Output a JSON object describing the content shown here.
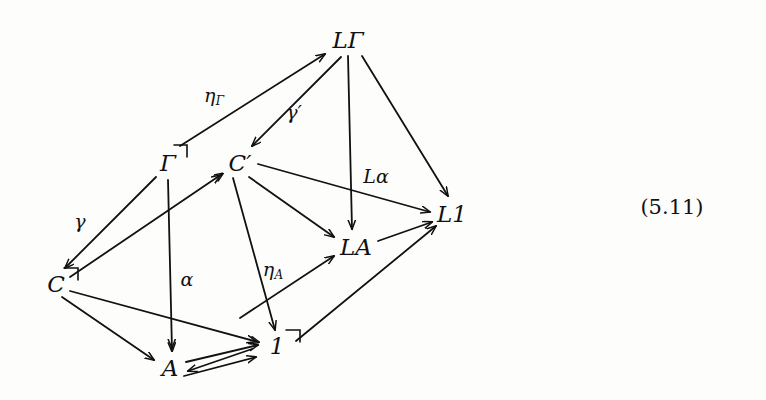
{
  "figure": {
    "kind": "commutative-diagram",
    "equation_number": "(5.11)",
    "equation_number_pos": {
      "x": 672,
      "y": 207
    },
    "background_color": "#fdfdfc",
    "ink_color": "#111111",
    "width": 766,
    "height": 400
  },
  "nodes": [
    {
      "id": "LGamma",
      "label": "LΓ",
      "x": 348,
      "y": 40,
      "corner_mark": false
    },
    {
      "id": "Gamma",
      "label": "Γ",
      "x": 168,
      "y": 163,
      "corner_mark": true
    },
    {
      "id": "Cprime",
      "label": "C′",
      "x": 240,
      "y": 163,
      "corner_mark": false
    },
    {
      "id": "L1",
      "label": "L1",
      "x": 452,
      "y": 214,
      "corner_mark": false
    },
    {
      "id": "LA",
      "label": "LA",
      "x": 356,
      "y": 247,
      "corner_mark": false
    },
    {
      "id": "C",
      "label": "C",
      "x": 56,
      "y": 284,
      "corner_mark": true
    },
    {
      "id": "one",
      "label": "1",
      "x": 277,
      "y": 346,
      "corner_mark": true
    },
    {
      "id": "A",
      "label": "A",
      "x": 170,
      "y": 368,
      "corner_mark": false
    }
  ],
  "edge_labels": [
    {
      "id": "eta-gamma",
      "base": "η",
      "sub": "Γ",
      "x": 214,
      "y": 96,
      "for": "Gamma->LGamma"
    },
    {
      "id": "gamma-prime",
      "base": "γ′",
      "sub": "",
      "x": 294,
      "y": 112,
      "for": "LGamma->Cprime"
    },
    {
      "id": "L-alpha",
      "base": "Lα",
      "sub": "",
      "x": 376,
      "y": 176,
      "for": "LGamma->LA"
    },
    {
      "id": "gamma",
      "base": "γ",
      "sub": "",
      "x": 80,
      "y": 221,
      "for": "Gamma->C"
    },
    {
      "id": "alpha",
      "base": "α",
      "sub": "",
      "x": 187,
      "y": 279,
      "for": "Gamma->A"
    },
    {
      "id": "eta-A",
      "base": "η",
      "sub": "A",
      "x": 273,
      "y": 270,
      "for": "A->LA"
    }
  ],
  "edges": [
    {
      "id": "Gamma->LGamma",
      "from": "Gamma",
      "to": "LGamma",
      "label": "ηΓ"
    },
    {
      "id": "LGamma->Cprime",
      "from": "LGamma",
      "to": "Cprime",
      "label": "γ′"
    },
    {
      "id": "LGamma->LA",
      "from": "LGamma",
      "to": "LA",
      "label": "Lα"
    },
    {
      "id": "LGamma->L1",
      "from": "LGamma",
      "to": "L1",
      "label": ""
    },
    {
      "id": "Cprime->L1",
      "from": "Cprime",
      "to": "L1",
      "label": ""
    },
    {
      "id": "Cprime->LA",
      "from": "Cprime",
      "to": "LA",
      "label": ""
    },
    {
      "id": "Cprime->one",
      "from": "Cprime",
      "to": "one",
      "label": ""
    },
    {
      "id": "Gamma->C",
      "from": "Gamma",
      "to": "C",
      "label": "γ"
    },
    {
      "id": "Gamma->A",
      "from": "Gamma",
      "to": "A",
      "label": "α"
    },
    {
      "id": "C->Cprime",
      "from": "C",
      "to": "Cprime",
      "label": ""
    },
    {
      "id": "C->A",
      "from": "C",
      "to": "A",
      "label": ""
    },
    {
      "id": "C->one",
      "from": "C",
      "to": "one",
      "label": ""
    },
    {
      "id": "A->LA",
      "from": "A",
      "to": "LA",
      "label": "ηA"
    },
    {
      "id": "A->one-upper",
      "from": "A",
      "to": "one",
      "label": ""
    },
    {
      "id": "A->one-lower",
      "from": "A",
      "to": "one",
      "label": ""
    },
    {
      "id": "one->A",
      "from": "one",
      "to": "A",
      "label": ""
    },
    {
      "id": "one->L1",
      "from": "one",
      "to": "L1",
      "label": ""
    },
    {
      "id": "LA->L1",
      "from": "LA",
      "to": "L1",
      "label": ""
    }
  ]
}
